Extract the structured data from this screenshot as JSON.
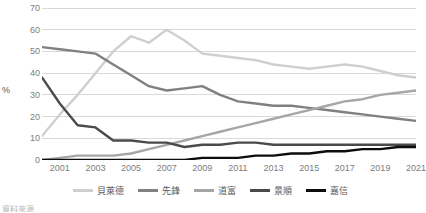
{
  "chart_data": {
    "type": "line",
    "title": "",
    "xlabel": "",
    "ylabel": "%",
    "ylim": [
      0,
      70
    ],
    "ytick_values": [
      0,
      10,
      20,
      30,
      40,
      50,
      60,
      70
    ],
    "ytick_labels": [
      "0",
      "10",
      "20",
      "30",
      "40",
      "50",
      "60",
      "70"
    ],
    "grid": true,
    "grid_axis": "y",
    "legend_position": "bottom",
    "x": [
      2000,
      2001,
      2002,
      2003,
      2004,
      2005,
      2006,
      2007,
      2008,
      2009,
      2010,
      2011,
      2012,
      2013,
      2014,
      2015,
      2016,
      2017,
      2018,
      2019,
      2020,
      2021
    ],
    "xtick_values": [
      2001,
      2003,
      2005,
      2007,
      2009,
      2011,
      2013,
      2015,
      2017,
      2019,
      2021
    ],
    "xtick_labels": [
      "2001",
      "2003",
      "2005",
      "2007",
      "2009",
      "2011",
      "2013",
      "2015",
      "2017",
      "2019",
      "2021"
    ],
    "series": [
      {
        "name": "貝萊德",
        "color": "#cfcfcf",
        "values": [
          11,
          21,
          30,
          40,
          50,
          57,
          54,
          60,
          55,
          49,
          48,
          47,
          46,
          44,
          43,
          42,
          43,
          44,
          43,
          41,
          39,
          38
        ]
      },
      {
        "name": "先鋒",
        "color": "#808080",
        "values": [
          52,
          51,
          50,
          49,
          44,
          39,
          34,
          32,
          33,
          34,
          30,
          27,
          26,
          25,
          25,
          24,
          23,
          22,
          21,
          20,
          19,
          18
        ]
      },
      {
        "name": "道富",
        "color": "#a6a6a6",
        "values": [
          0,
          1,
          2,
          2,
          2,
          3,
          5,
          7,
          9,
          11,
          13,
          15,
          17,
          19,
          21,
          23,
          25,
          27,
          28,
          30,
          31,
          32
        ]
      },
      {
        "name": "景順",
        "color": "#4a4a4a",
        "values": [
          38,
          26,
          16,
          15,
          9,
          9,
          8,
          8,
          6,
          7,
          7,
          8,
          8,
          7,
          7,
          7,
          7,
          7,
          7,
          7,
          7,
          7
        ]
      },
      {
        "name": "嘉信",
        "color": "#0d0d0d",
        "values": [
          0,
          0,
          0,
          0,
          0,
          0,
          0,
          0,
          0,
          1,
          1,
          1,
          2,
          2,
          3,
          3,
          4,
          4,
          5,
          5,
          6,
          6
        ]
      }
    ]
  },
  "footnote": {
    "text": "資料來源"
  }
}
